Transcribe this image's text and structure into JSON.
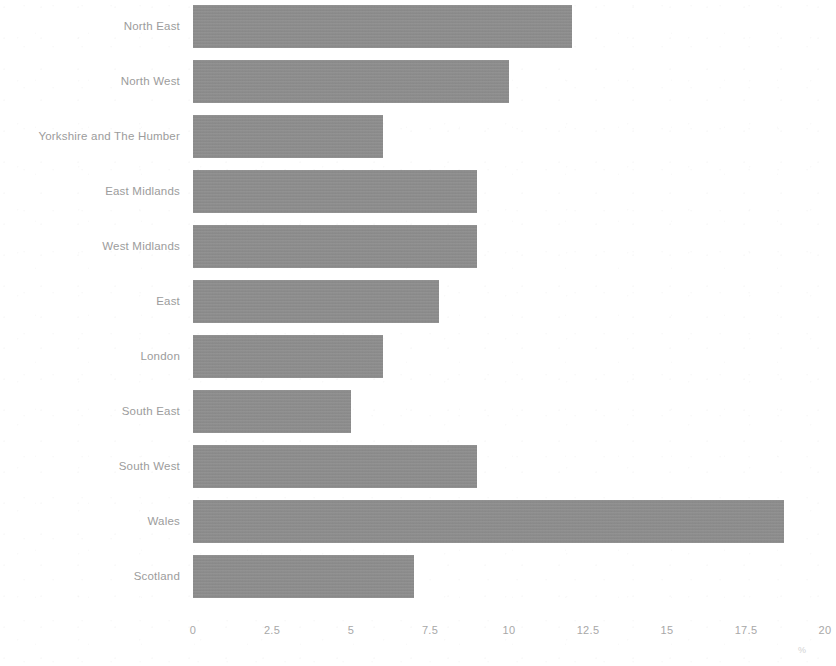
{
  "chart_data": {
    "type": "bar",
    "orientation": "horizontal",
    "title": "",
    "subtitle": "",
    "xlabel": "",
    "ylabel": "",
    "categories": [
      "North East",
      "North West",
      "Yorkshire and The Humber",
      "East Midlands",
      "West Midlands",
      "East",
      "London",
      "South East",
      "South West",
      "Wales",
      "Scotland"
    ],
    "values": [
      12,
      10,
      6,
      9,
      9,
      7.8,
      6,
      5,
      9,
      18.7,
      7
    ],
    "xlim": [
      0,
      20
    ],
    "xticks": [
      0,
      2.5,
      5,
      7.5,
      10,
      12.5,
      15,
      17.5,
      20
    ],
    "xtick_labels": [
      "0",
      "2.5",
      "5",
      "7.5",
      "10",
      "12.5",
      "15",
      "17.5",
      "20"
    ],
    "grid": false,
    "legend": false,
    "bar_color": "#8e8e8e",
    "label_color": "#9c9c9c",
    "tick_color": "#a8a8a8",
    "background_color": "#ffffff",
    "axis_unit_mark": "%"
  }
}
